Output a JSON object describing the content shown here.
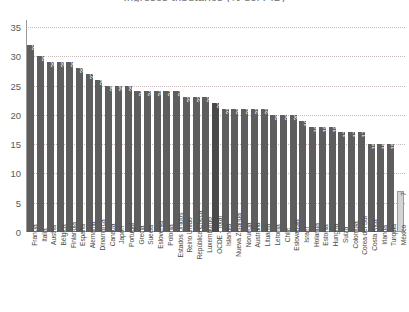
{
  "chart_data": {
    "type": "bar",
    "title": "Ingresos tributarios (% del PIB)",
    "xlabel": "",
    "ylabel": "",
    "ylim": [
      0,
      35
    ],
    "yticks": [
      "0",
      "5",
      "10",
      "15",
      "20",
      "25",
      "30",
      "35"
    ],
    "grid": true,
    "legend": "none",
    "orientation": "vertical",
    "bar_color": "#5e5e5e",
    "highlight_color": "#d4d4d4",
    "total_color": "#4a4a4a",
    "highlight_category": "México",
    "total_category": "OCDE - Total",
    "categories": [
      "Francia",
      "Italia",
      "Austria",
      "Bélgica",
      "Finlandia",
      "España",
      "Alemania",
      "Dinamarca",
      "Canadá",
      "Japón",
      "Portugal",
      "Grecia",
      "Suecia",
      "Eslovenia",
      "Polonia",
      "Estados Unidos",
      "Reino Unido",
      "República Checa",
      "Luxemburgo",
      "OCDE - Total",
      "Islandia",
      "Nueva Zelanda",
      "Noruega",
      "Australia",
      "Lituania",
      "Letonia",
      "Chile",
      "Eslovaquia",
      "Israel",
      "Holanda",
      "Estonia",
      "Hungría",
      "Suiza",
      "Colombia",
      "Corea del Sur",
      "Costa Rica",
      "Irlanda",
      "Turquía",
      "México"
    ],
    "values": [
      32,
      30,
      29,
      29,
      29,
      28,
      27,
      26,
      25,
      25,
      25,
      24,
      24,
      24,
      24,
      24,
      23,
      23,
      23,
      22,
      21,
      21,
      21,
      21,
      21,
      20,
      20,
      20,
      19,
      18,
      18,
      18,
      17,
      17,
      17,
      15,
      15,
      15,
      7
    ],
    "value_labels": [
      "32",
      "30",
      "29",
      "29",
      "29",
      "28",
      "27",
      "26",
      "25",
      "25",
      "25",
      "24",
      "24",
      "24",
      "24",
      "24",
      "23",
      "23",
      "23",
      "22",
      "21",
      "21",
      "21",
      "21",
      "21",
      "20",
      "20",
      "20",
      "19",
      "18",
      "18",
      "18",
      "17",
      "17",
      "17",
      "15",
      "15",
      "15",
      "7"
    ]
  }
}
